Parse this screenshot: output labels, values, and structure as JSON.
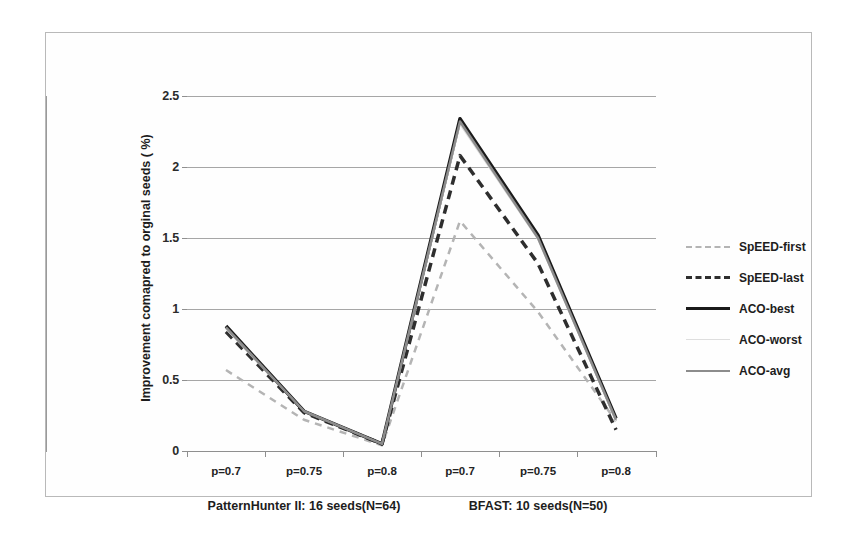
{
  "chart_data": {
    "type": "line",
    "title": "",
    "xlabel": "",
    "ylabel": "Improvement comapred to orginal seeds ( %)",
    "ylim": [
      0,
      2.5
    ],
    "yticks": [
      "0",
      "0.5",
      "1",
      "1.5",
      "2",
      "2.5"
    ],
    "ytick_values": [
      0,
      0.5,
      1,
      1.5,
      2,
      2.5
    ],
    "grid": true,
    "legend_position": "right",
    "categories": [
      "p=0.7",
      "p=0.75",
      "p=0.8",
      "p=0.7",
      "p=0.75",
      "p=0.8"
    ],
    "groups": [
      {
        "label": "PatternHunter II: 16 seeds(N=64)",
        "categories": [
          "p=0.7",
          "p=0.75",
          "p=0.8"
        ]
      },
      {
        "label": "BFAST: 10 seeds(N=50)",
        "categories": [
          "p=0.7",
          "p=0.75",
          "p=0.8"
        ]
      }
    ],
    "series": [
      {
        "name": "SpEED-first",
        "style": "dashed",
        "color": "#b4b4b4",
        "width": 2.5,
        "values": [
          0.57,
          0.22,
          0.04,
          1.62,
          0.98,
          0.21
        ]
      },
      {
        "name": "SpEED-last",
        "style": "dashed",
        "color": "#2e2e2e",
        "width": 3.5,
        "values": [
          0.84,
          0.27,
          0.05,
          2.08,
          1.32,
          0.15
        ]
      },
      {
        "name": "ACO-best",
        "style": "solid",
        "color": "#1a1a1a",
        "width": 3.5,
        "values": [
          0.88,
          0.28,
          0.05,
          2.34,
          1.52,
          0.23
        ]
      },
      {
        "name": "ACO-worst",
        "style": "solid",
        "color": "#dedede",
        "width": 1.5,
        "values": [
          0.86,
          0.28,
          0.05,
          2.3,
          1.49,
          0.21
        ]
      },
      {
        "name": "ACO-avg",
        "style": "solid",
        "color": "#8c8c8c",
        "width": 2.5,
        "values": [
          0.87,
          0.28,
          0.05,
          2.32,
          1.5,
          0.22
        ]
      }
    ]
  },
  "legend": {
    "items": [
      {
        "label": "SpEED-first"
      },
      {
        "label": "SpEED-last"
      },
      {
        "label": "ACO-best"
      },
      {
        "label": "ACO-worst"
      },
      {
        "label": "ACO-avg"
      }
    ]
  }
}
